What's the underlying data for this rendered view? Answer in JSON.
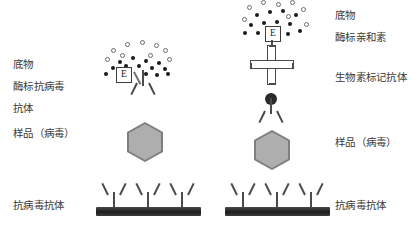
{
  "diagram": {
    "type": "immunoassay-schematic",
    "panels": [
      {
        "id": "left-panel",
        "name": "直接酶标夹心法",
        "labels_side": "left",
        "labels": [
          {
            "key": "substrate",
            "text": "底物"
          },
          {
            "key": "enzyme_conjugate",
            "text": "酶标抗病毒"
          },
          {
            "key": "antibody",
            "text": "抗体"
          },
          {
            "key": "sample",
            "text": "样品（病毒）"
          },
          {
            "key": "capture_antibody",
            "text": "抗病毒抗体"
          }
        ],
        "enzyme_glyph": "E",
        "capture_antibody_count": 3,
        "substrate_filled_dots": 13,
        "substrate_open_rings": 9
      },
      {
        "id": "right-panel",
        "name": "生物素-亲和素放大法",
        "labels_side": "right",
        "labels": [
          {
            "key": "substrate",
            "text": "底物"
          },
          {
            "key": "enzyme_avidin",
            "text": "酶标亲和素"
          },
          {
            "key": "biotin_antibody",
            "text": "生物素标记抗体"
          },
          {
            "key": "sample",
            "text": "样品（病毒）"
          },
          {
            "key": "capture_antibody",
            "text": "抗病毒抗体"
          }
        ],
        "enzyme_glyph": "E",
        "capture_antibody_count": 3,
        "substrate_filled_dots": 12,
        "substrate_open_rings": 8
      }
    ],
    "colors": {
      "background": "#ffffff",
      "label_text": "#3a3a3a",
      "antibody_stroke": "#4b4b4b",
      "plate_dark": "#1d1d1d",
      "hexagon_fill": "#aeaeae",
      "hexagon_border": "#7e7e7e",
      "substrate_dot": "#1a1a1a",
      "substrate_ring": "#6b6b6b",
      "biotin": "#2a2a2a"
    }
  }
}
